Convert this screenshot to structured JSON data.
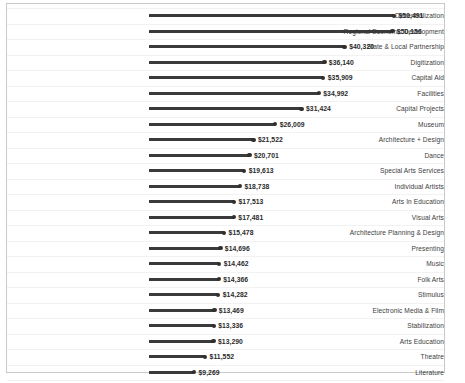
{
  "chart_data": {
    "type": "bar",
    "subtype": "lollipop-horizontal",
    "title": "",
    "subtitle": "",
    "xlabel": "",
    "ylabel": "",
    "grid": true,
    "legend": null,
    "orientation": "horizontal",
    "xlim": [
      0,
      50491
    ],
    "value_prefix": "$",
    "categories": [
      "Decentralization",
      "Regional Economic Development",
      "State & Local Partnership",
      "Digitization",
      "Capital Aid",
      "Facilities",
      "Capital Projects",
      "Museum",
      "Architecture + Design",
      "Dance",
      "Special Arts Services",
      "Individual Artists",
      "Arts In Education",
      "Visual Arts",
      "Architecture Planning & Design",
      "Presenting",
      "Music",
      "Folk Arts",
      "Stimulus",
      "Electronic Media & Film",
      "Stabilization",
      "Arts Education",
      "Theatre",
      "Literature"
    ],
    "values": [
      50491,
      50156,
      40320,
      36140,
      35909,
      34992,
      31424,
      26009,
      21522,
      20701,
      19613,
      18738,
      17513,
      17481,
      15478,
      14696,
      14462,
      14366,
      14282,
      13469,
      13336,
      13290,
      11552,
      9269
    ],
    "value_labels": [
      "$50,491",
      "$50,156",
      "$40,320",
      "$36,140",
      "$35,909",
      "$34,992",
      "$31,424",
      "$26,009",
      "$21,522",
      "$20,701",
      "$19,613",
      "$18,738",
      "$17,513",
      "$17,481",
      "$15,478",
      "$14,696",
      "$14,462",
      "$14,366",
      "$14,282",
      "$13,469",
      "$13,336",
      "$13,290",
      "$11,552",
      "$9,269"
    ],
    "colors": {
      "line": "#3a3a3a",
      "dot": "#2f2f2f",
      "label": "#3c3c3c",
      "value": "#2b2b2b",
      "grid": "#f2f2f2",
      "border": "#c9c9c9",
      "background": "#ffffff"
    }
  }
}
